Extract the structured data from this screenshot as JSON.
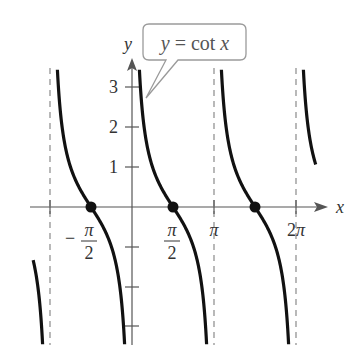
{
  "chart_data": {
    "type": "line",
    "title": "",
    "function": "y = cot x",
    "callout_label": "y = cot x",
    "xlabel": "x",
    "ylabel": "y",
    "x_ticks": [
      {
        "value": -3.14159,
        "label": ""
      },
      {
        "value": -1.5708,
        "label": "-π/2"
      },
      {
        "value": 1.5708,
        "label": "π/2"
      },
      {
        "value": 3.14159,
        "label": "π"
      },
      {
        "value": 6.28319,
        "label": "2π"
      }
    ],
    "y_ticks": [
      {
        "value": 3,
        "label": "3"
      },
      {
        "value": 2,
        "label": "2"
      },
      {
        "value": 1,
        "label": "1"
      },
      {
        "value": -1,
        "label": ""
      },
      {
        "value": -2,
        "label": ""
      },
      {
        "value": -3,
        "label": ""
      }
    ],
    "asymptotes": [
      -3.14159,
      0,
      3.14159,
      6.28319
    ],
    "zeros": [
      -1.5708,
      1.5708,
      4.71239
    ],
    "xlim": [
      -3.9,
      7.2
    ],
    "ylim": [
      -3.0,
      3.6
    ],
    "grid": false,
    "legend": "none",
    "series": [
      {
        "name": "cot x branch (-2π,-π)",
        "x": [
          -3.65,
          -3.15
        ],
        "y_range_visible": [
          -1.8,
          -3.0
        ]
      },
      {
        "name": "cot x branch (-π,0)",
        "x": [
          -3.0,
          -1.5708,
          -0.17
        ],
        "y": [
          7.0,
          0,
          -5.9
        ]
      },
      {
        "name": "cot x branch (0,π)",
        "x": [
          0.14,
          1.5708,
          2.97
        ],
        "y": [
          7.0,
          0,
          -5.9
        ]
      },
      {
        "name": "cot x branch (π,2π)",
        "x": [
          3.28,
          4.71239,
          6.11
        ],
        "y": [
          7.0,
          0,
          -5.9
        ]
      },
      {
        "name": "cot x branch (2π,3π)",
        "x": [
          6.42,
          6.86
        ],
        "y": [
          7.0,
          2.0
        ]
      }
    ],
    "colors": {
      "curve": "#111111",
      "axis": "#555555",
      "asymptote": "#888888",
      "callout_border": "#9a9a9a",
      "text": "#333333"
    }
  }
}
